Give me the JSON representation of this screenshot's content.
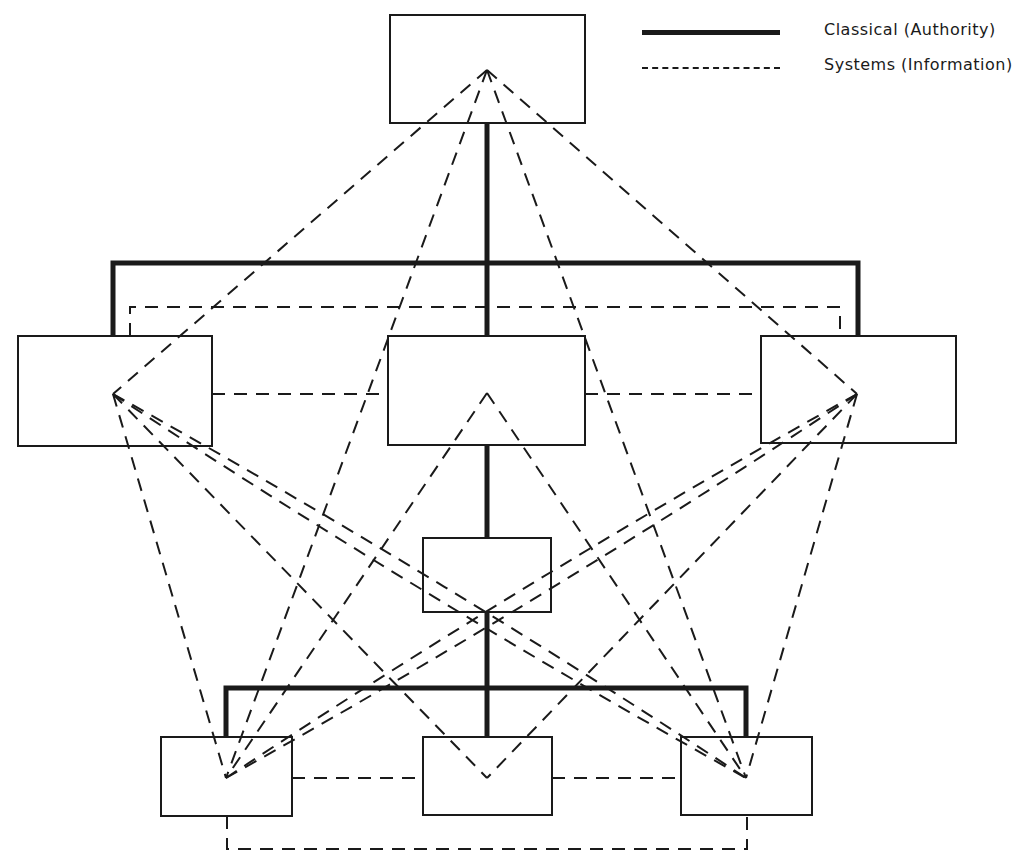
{
  "legend": {
    "items": [
      {
        "label": "Classical (Authority)",
        "style": "solid-thick"
      },
      {
        "label": "Systems (Information)",
        "style": "dashed"
      }
    ]
  },
  "colors": {
    "ink": "#1a1a1a",
    "background": "#ffffff"
  },
  "diagram": {
    "boxes": [
      {
        "id": "top",
        "x": 390,
        "y": 15,
        "w": 195,
        "h": 108,
        "apex": [
          487,
          70
        ]
      },
      {
        "id": "mid-left",
        "x": 18,
        "y": 336,
        "w": 194,
        "h": 110,
        "apex": [
          113,
          394
        ]
      },
      {
        "id": "mid-center",
        "x": 388,
        "y": 336,
        "w": 197,
        "h": 109,
        "apex": [
          487,
          393
        ]
      },
      {
        "id": "mid-right",
        "x": 761,
        "y": 336,
        "w": 195,
        "h": 107,
        "apex": [
          857,
          394
        ]
      },
      {
        "id": "center-small",
        "x": 423,
        "y": 538,
        "w": 128,
        "h": 74
      },
      {
        "id": "bottom-left",
        "x": 161,
        "y": 737,
        "w": 131,
        "h": 79,
        "apex": [
          226,
          778
        ]
      },
      {
        "id": "bottom-center",
        "x": 423,
        "y": 737,
        "w": 129,
        "h": 78,
        "apex": [
          487,
          778
        ]
      },
      {
        "id": "bottom-right",
        "x": 681,
        "y": 737,
        "w": 131,
        "h": 78,
        "apex": [
          746,
          778
        ]
      }
    ],
    "authority_lines": [
      [
        [
          487,
          123
        ],
        [
          487,
          336
        ]
      ],
      [
        [
          113,
          336
        ],
        [
          113,
          263
        ],
        [
          858,
          263
        ],
        [
          858,
          336
        ]
      ],
      [
        [
          487,
          445
        ],
        [
          487,
          538
        ]
      ],
      [
        [
          487,
          612
        ],
        [
          487,
          737
        ]
      ],
      [
        [
          226,
          737
        ],
        [
          226,
          688
        ],
        [
          746,
          688
        ],
        [
          746,
          737
        ]
      ]
    ],
    "information_lines": [
      [
        [
          130,
          336
        ],
        [
          130,
          307
        ],
        [
          840,
          307
        ],
        [
          840,
          336
        ]
      ],
      [
        [
          212,
          394
        ],
        [
          388,
          394
        ]
      ],
      [
        [
          585,
          394
        ],
        [
          761,
          394
        ]
      ],
      [
        [
          292,
          778
        ],
        [
          423,
          778
        ]
      ],
      [
        [
          552,
          778
        ],
        [
          681,
          778
        ]
      ],
      [
        [
          227,
          816
        ],
        [
          227,
          849
        ],
        [
          747,
          849
        ],
        [
          747,
          815
        ]
      ],
      [
        [
          487,
          70
        ],
        [
          113,
          394
        ]
      ],
      [
        [
          487,
          70
        ],
        [
          857,
          394
        ]
      ],
      [
        [
          487,
          70
        ],
        [
          226,
          778
        ]
      ],
      [
        [
          487,
          70
        ],
        [
          746,
          778
        ]
      ],
      [
        [
          487,
          393
        ],
        [
          226,
          778
        ]
      ],
      [
        [
          487,
          393
        ],
        [
          746,
          778
        ]
      ],
      [
        [
          113,
          394
        ],
        [
          226,
          778
        ]
      ],
      [
        [
          113,
          394
        ],
        [
          487,
          778
        ]
      ],
      [
        [
          857,
          394
        ],
        [
          746,
          778
        ]
      ],
      [
        [
          857,
          394
        ],
        [
          487,
          778
        ]
      ]
    ],
    "information_curves": [
      {
        "from": [
          113,
          394
        ],
        "to": [
          746,
          778
        ],
        "bend": -14
      },
      {
        "from": [
          113,
          394
        ],
        "to": [
          746,
          778
        ],
        "bend": 14
      },
      {
        "from": [
          857,
          394
        ],
        "to": [
          226,
          778
        ],
        "bend": 14
      },
      {
        "from": [
          857,
          394
        ],
        "to": [
          226,
          778
        ],
        "bend": -14
      }
    ]
  }
}
